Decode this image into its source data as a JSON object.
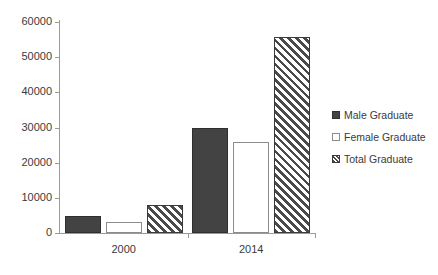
{
  "chart_data": {
    "type": "bar",
    "title": "",
    "subtitle": "",
    "xlabel": "",
    "ylabel": "",
    "categories": [
      "2000",
      "2014"
    ],
    "series": [
      {
        "name": "Male Graduate",
        "values": [
          4800,
          29900
        ],
        "fill": "solid",
        "color": "#434343"
      },
      {
        "name": "Female Graduate",
        "values": [
          3200,
          26000
        ],
        "fill": "open",
        "color": "#ffffff"
      },
      {
        "name": "Total Graduate",
        "values": [
          8000,
          55700
        ],
        "fill": "hatch",
        "color": "#4a4a4a"
      }
    ],
    "ylim": [
      0,
      60000
    ],
    "ytick_step": 10000,
    "yticks": [
      "60000",
      "50000",
      "40000",
      "30000",
      "20000",
      "10000",
      "0"
    ],
    "grid": false,
    "legend_position": "right",
    "axis_color": "#9a9a9a",
    "text_color": "#3a3a3a",
    "background": "#ffffff"
  },
  "legend": {
    "items": [
      {
        "label": "Male Graduate"
      },
      {
        "label": "Female Graduate"
      },
      {
        "label": "Total Graduate"
      }
    ]
  },
  "axes": {
    "x_categories": [
      {
        "label": "2000"
      },
      {
        "label": "2014"
      }
    ],
    "y_tick_labels": [
      {
        "value": "60000"
      },
      {
        "value": "50000"
      },
      {
        "value": "40000"
      },
      {
        "value": "30000"
      },
      {
        "value": "20000"
      },
      {
        "value": "10000"
      },
      {
        "value": "0"
      }
    ]
  }
}
